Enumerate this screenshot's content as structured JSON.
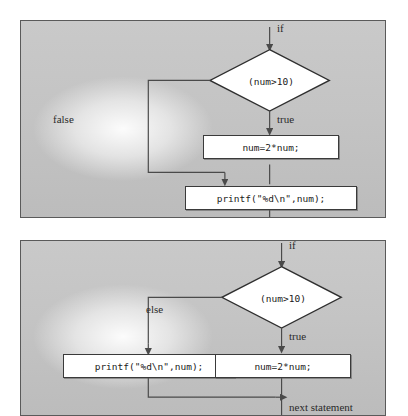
{
  "figure": {
    "kind": "flowchart-pair",
    "background_color": "#ffffff",
    "panel_fill": "#c4c4c4",
    "panel_border": "#5a5a5a",
    "node_fill": "#ffffff",
    "node_border": "#3a3a3a",
    "line_color": "#4a4a4a",
    "text_color": "#1a1a1a"
  },
  "panels": [
    {
      "id": "if-statement",
      "name": "if flowchart",
      "entry_label": "if",
      "decision": "(num>10)",
      "true_label": "true",
      "false_label": "false",
      "true_branch_statement": "num=2*num;",
      "merge_statement": "printf(\"%d\\n\",num);"
    },
    {
      "id": "if-else-statement",
      "name": "if-else flowchart",
      "entry_label": "if",
      "decision": "(num>10)",
      "true_label": "true",
      "else_label": "else",
      "true_branch_statement": "num=2*num;",
      "else_branch_statement": "printf(\"%d\\n\",num);",
      "exit_label": "next statement"
    }
  ]
}
